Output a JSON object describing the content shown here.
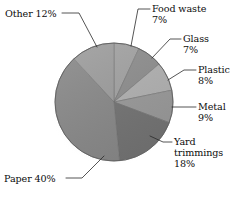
{
  "chart_data": {
    "type": "pie",
    "title": "",
    "subtitle": "",
    "xlabel": "",
    "ylabel": "",
    "legend_position": "callout-labels",
    "grid": false,
    "units": "percent",
    "total": 101,
    "start_angle_deg": 0,
    "direction": "clockwise",
    "categories": [
      "Food waste",
      "Glass",
      "Plastic",
      "Metal",
      "Yard trimmings",
      "Paper",
      "Other"
    ],
    "values": [
      7,
      7,
      8,
      9,
      18,
      40,
      12
    ],
    "value_labels": [
      "7%",
      "7%",
      "8%",
      "9%",
      "18%",
      "40%",
      "12%"
    ],
    "colors": [
      "#a3a3a3",
      "#8f8f8f",
      "#b2b2b2",
      "#9b9b9b",
      "#757575",
      "#8a8a8a",
      "#9e9e9e"
    ],
    "slices": [
      {
        "name": "Food waste",
        "value": 7,
        "value_label": "7%",
        "color": "#a3a3a3",
        "start_deg": 0,
        "end_deg": 25.2
      },
      {
        "name": "Glass",
        "value": 7,
        "value_label": "7%",
        "color": "#8f8f8f",
        "start_deg": 25.2,
        "end_deg": 50.4
      },
      {
        "name": "Plastic",
        "value": 8,
        "value_label": "8%",
        "color": "#b2b2b2",
        "start_deg": 50.4,
        "end_deg": 79.2
      },
      {
        "name": "Metal",
        "value": 9,
        "value_label": "9%",
        "color": "#9b9b9b",
        "start_deg": 79.2,
        "end_deg": 111.6
      },
      {
        "name": "Yard trimmings",
        "value": 18,
        "value_label": "18%",
        "color": "#757575",
        "start_deg": 111.6,
        "end_deg": 176.4
      },
      {
        "name": "Paper",
        "value": 40,
        "value_label": "40%",
        "color": "#8a8a8a",
        "start_deg": 176.4,
        "end_deg": 320.4
      },
      {
        "name": "Other",
        "value": 12,
        "value_label": "12%",
        "color": "#9e9e9e",
        "start_deg": 320.4,
        "end_deg": 360
      }
    ]
  },
  "labels": {
    "other": {
      "name": "Other",
      "text": "Other 12%"
    },
    "food_waste": {
      "name": "Food waste",
      "pct": "7%"
    },
    "glass": {
      "name": "Glass",
      "pct": "7%"
    },
    "plastic": {
      "name": "Plastic",
      "pct": "8%"
    },
    "metal": {
      "name": "Metal",
      "pct": "9%"
    },
    "yard": {
      "line1": "Yard",
      "line2": "trimmings",
      "pct": "18%"
    },
    "paper": {
      "text": "Paper 40%"
    }
  }
}
